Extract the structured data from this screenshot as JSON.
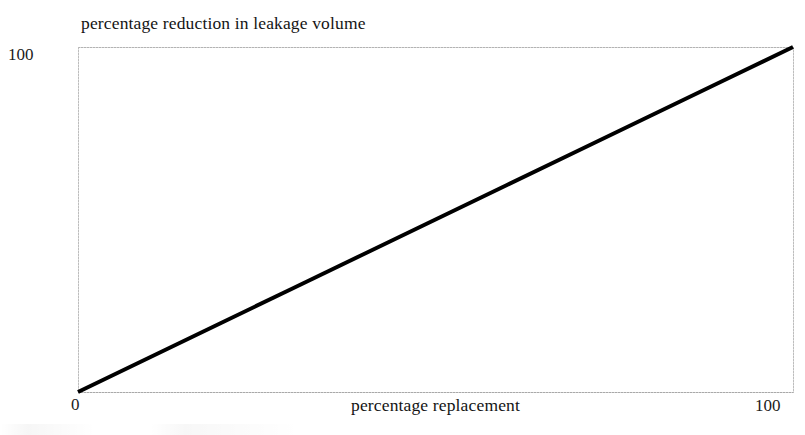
{
  "figure": {
    "title": "percentage reduction in leakage volume",
    "xaxis_title": "percentage replacement",
    "ytick_top": "100",
    "xtick_left": "0",
    "xtick_right": "100"
  },
  "chart_data": {
    "type": "line",
    "title": "percentage reduction in leakage volume",
    "subtitle": "",
    "xlabel": "percentage replacement",
    "ylabel": "percentage reduction in leakage volume",
    "xlim": [
      0,
      100
    ],
    "ylim": [
      0,
      100
    ],
    "xticks": [
      0,
      100
    ],
    "yticks": [
      0,
      100
    ],
    "xtick_labels": [
      "0",
      "100"
    ],
    "ytick_labels": [
      "",
      "100"
    ],
    "grid": false,
    "legend": null,
    "legend_position": "none",
    "annotations": [],
    "series": [
      {
        "name": "percentage reduction in leakage volume",
        "color": "#000000",
        "linewidth": 4,
        "x": [
          0,
          10,
          20,
          30,
          40,
          50,
          60,
          70,
          80,
          90,
          100
        ],
        "values": [
          0,
          10,
          20,
          30,
          40,
          50,
          60,
          70,
          80,
          90,
          100
        ]
      }
    ]
  },
  "style": {
    "line_color": "#000000",
    "frame_color": "#b9b9b9",
    "background": "#ffffff",
    "text_color": "#141414"
  }
}
